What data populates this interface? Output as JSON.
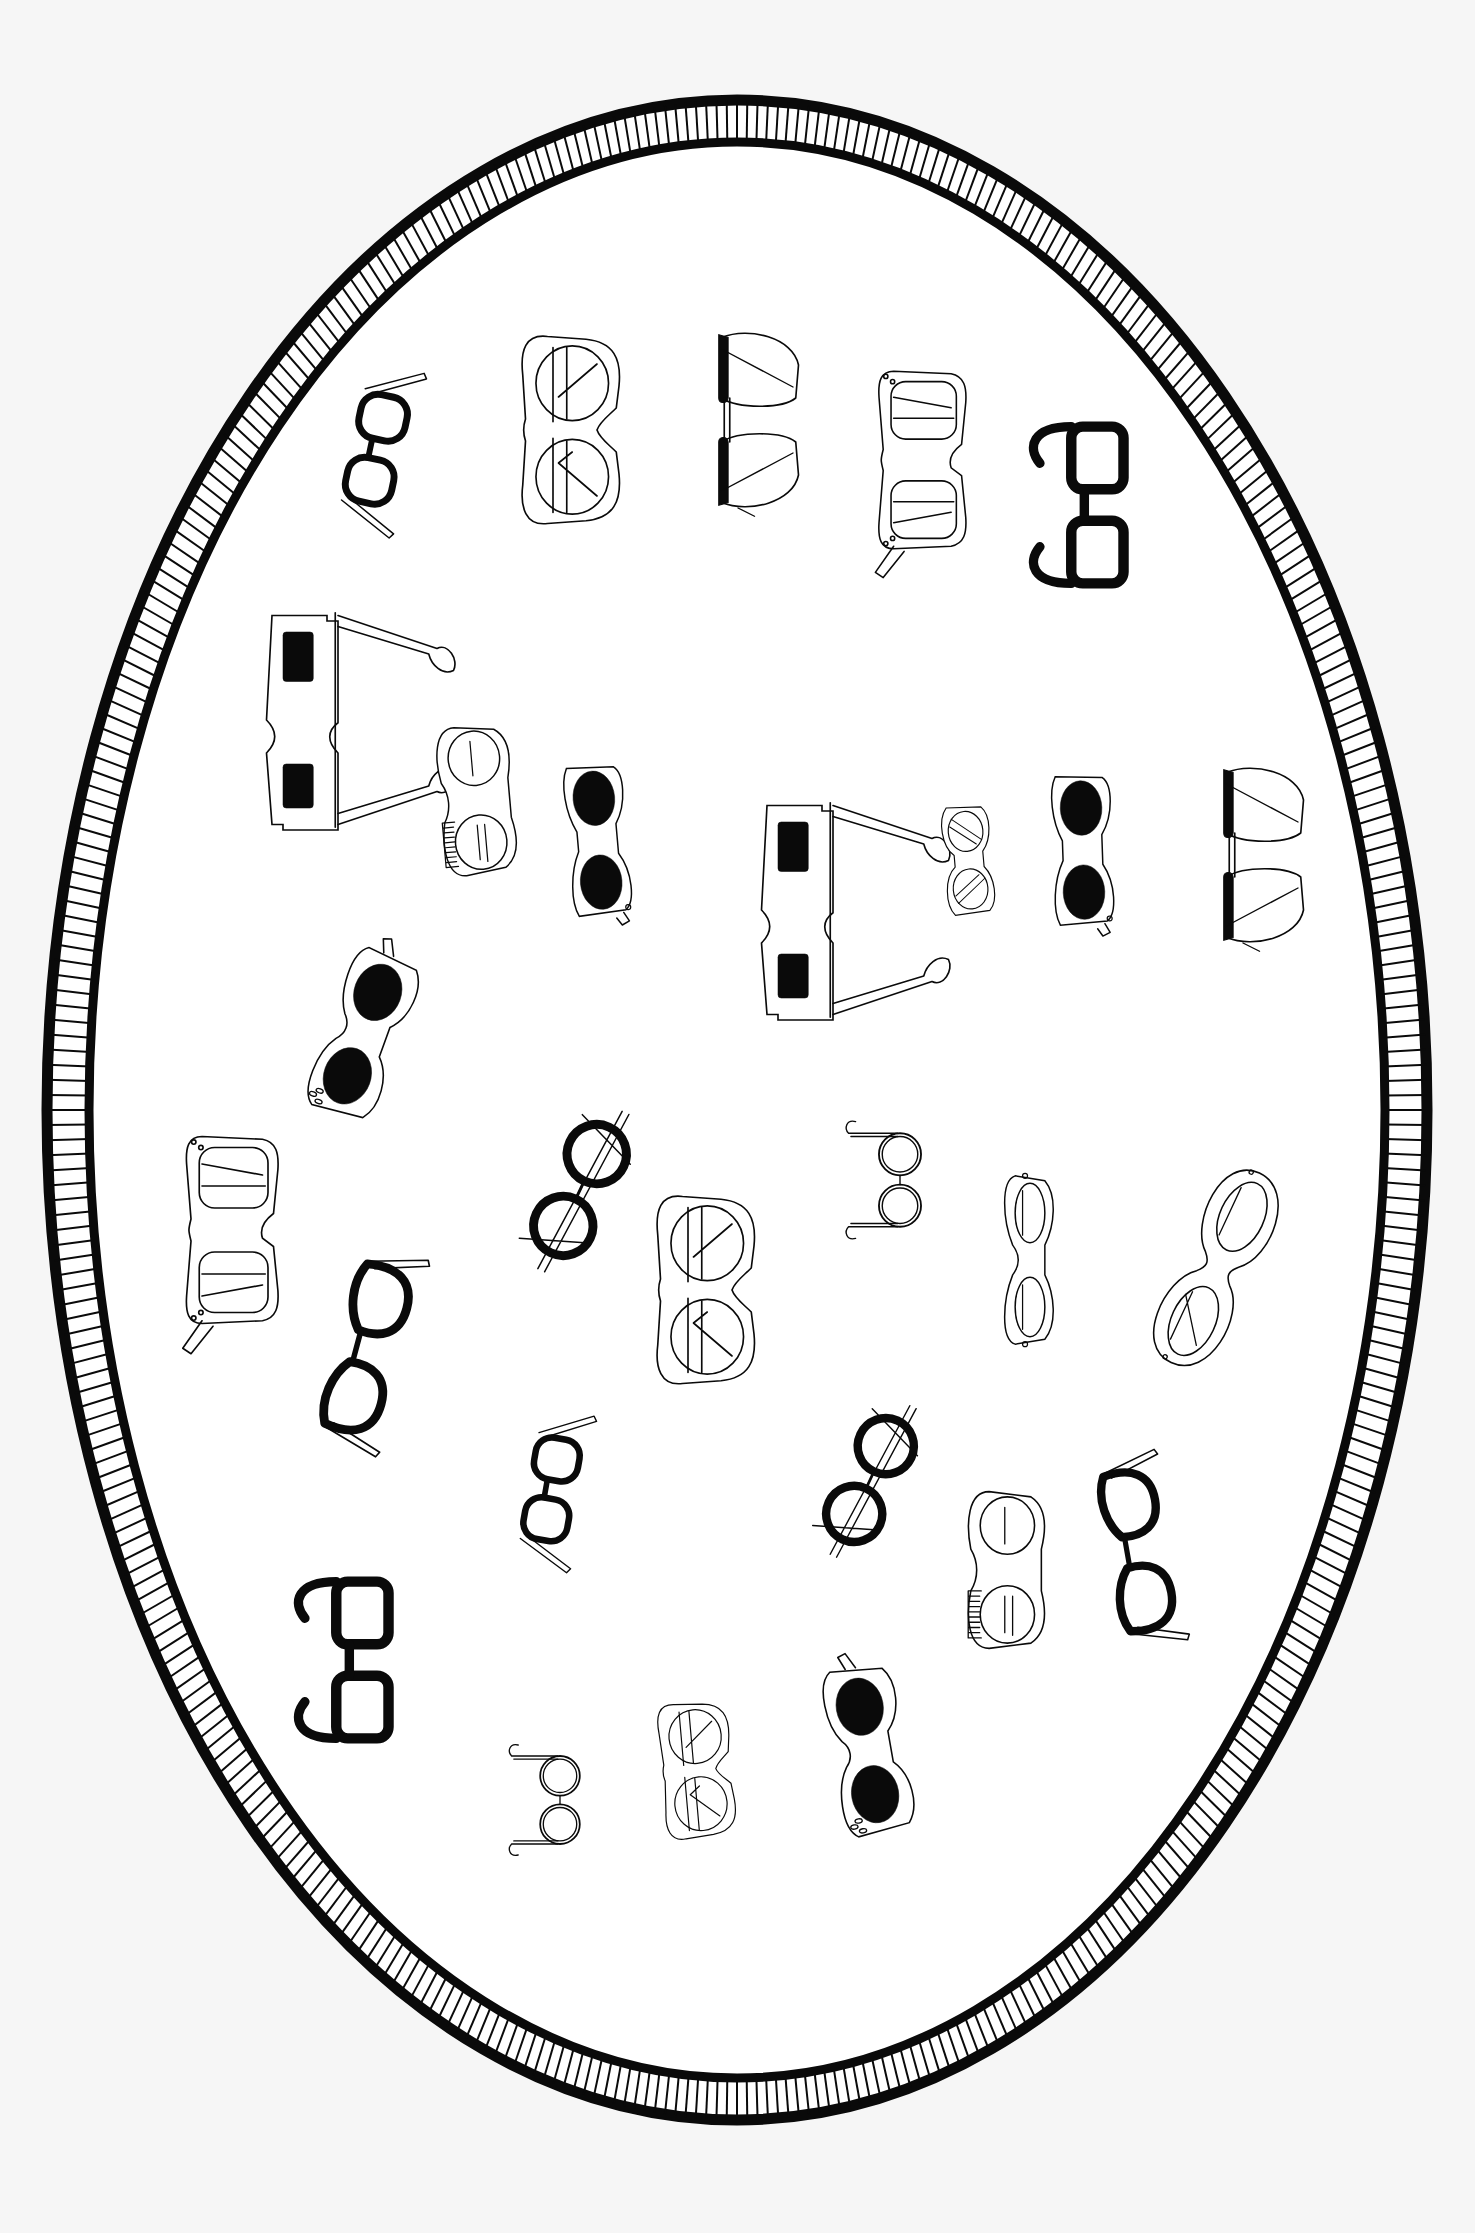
{
  "illustration": {
    "subject": "oval frame filled with assorted eyeglasses",
    "background": "#f6f6f6",
    "ink": "#0a0a0a",
    "frame": {
      "cx": 737,
      "cy": 1110,
      "rx": 680,
      "ry": 1010,
      "band": 38,
      "hatch_count": 420
    },
    "glasses": [
      {
        "type": "thick-black-small",
        "x": 380,
        "y": 450,
        "rot": -78,
        "s": 0.9
      },
      {
        "type": "outline-wayfarer",
        "x": 575,
        "y": 430,
        "rot": -90,
        "s": 1.0
      },
      {
        "type": "browline",
        "x": 760,
        "y": 420,
        "rot": -90,
        "s": 1.0
      },
      {
        "type": "outline-dots",
        "x": 925,
        "y": 460,
        "rot": -90,
        "s": 0.95
      },
      {
        "type": "thick-black-big",
        "x": 1100,
        "y": 505,
        "rot": -90,
        "s": 0.95
      },
      {
        "type": "3d",
        "x": 305,
        "y": 720,
        "rot": -90,
        "s": 1.0
      },
      {
        "type": "outline-brush",
        "x": 480,
        "y": 800,
        "rot": -95,
        "s": 0.9
      },
      {
        "type": "black-lens-cateye",
        "x": 600,
        "y": 840,
        "rot": -95,
        "s": 0.9
      },
      {
        "type": "3d",
        "x": 800,
        "y": 910,
        "rot": -90,
        "s": 1.0
      },
      {
        "type": "outline-small-round",
        "x": 970,
        "y": 860,
        "rot": -95,
        "s": 0.7
      },
      {
        "type": "black-lens-cateye",
        "x": 1085,
        "y": 850,
        "rot": -92,
        "s": 0.9
      },
      {
        "type": "browline",
        "x": 1265,
        "y": 855,
        "rot": -90,
        "s": 1.0
      },
      {
        "type": "black-oval-cateye",
        "x": 365,
        "y": 1035,
        "rot": -70,
        "s": 0.95
      },
      {
        "type": "outline-dots",
        "x": 235,
        "y": 1230,
        "rot": -90,
        "s": 1.0
      },
      {
        "type": "thick-round",
        "x": 580,
        "y": 1190,
        "rot": -65,
        "s": 0.9
      },
      {
        "type": "outline-wayfarer",
        "x": 710,
        "y": 1290,
        "rot": -90,
        "s": 1.0
      },
      {
        "type": "wire-round",
        "x": 900,
        "y": 1180,
        "rot": -90,
        "s": 0.85
      },
      {
        "type": "outline-cateye-tall",
        "x": 1030,
        "y": 1260,
        "rot": -90,
        "s": 0.9
      },
      {
        "type": "outline-bubble",
        "x": 1220,
        "y": 1270,
        "rot": -65,
        "s": 0.95
      },
      {
        "type": "thick-black-cateye",
        "x": 370,
        "y": 1350,
        "rot": -75,
        "s": 1.0
      },
      {
        "type": "thick-black-small",
        "x": 555,
        "y": 1490,
        "rot": -80,
        "s": 0.85
      },
      {
        "type": "thick-round",
        "x": 870,
        "y": 1480,
        "rot": -65,
        "s": 0.85
      },
      {
        "type": "outline-brush",
        "x": 1010,
        "y": 1570,
        "rot": -90,
        "s": 0.95
      },
      {
        "type": "thick-black-cateye",
        "x": 1140,
        "y": 1550,
        "rot": -100,
        "s": 0.95
      },
      {
        "type": "thick-black-big",
        "x": 365,
        "y": 1660,
        "rot": -90,
        "s": 0.95
      },
      {
        "type": "wire-round",
        "x": 560,
        "y": 1800,
        "rot": -90,
        "s": 0.8
      },
      {
        "type": "outline-wayfarer-small",
        "x": 700,
        "y": 1770,
        "rot": -95,
        "s": 0.9
      },
      {
        "type": "black-oval-cateye",
        "x": 870,
        "y": 1750,
        "rot": -100,
        "s": 0.95
      }
    ]
  }
}
